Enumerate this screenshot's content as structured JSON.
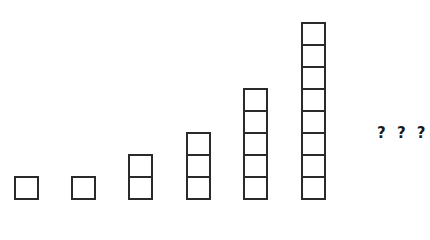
{
  "diagram": {
    "sequence": [
      1,
      1,
      2,
      3,
      5,
      8
    ],
    "columns": [
      {
        "index": 1,
        "squares": 1,
        "left": 14,
        "bottom": 200
      },
      {
        "index": 2,
        "squares": 1,
        "left": 71,
        "bottom": 200
      },
      {
        "index": 3,
        "squares": 2,
        "left": 128,
        "bottom": 200
      },
      {
        "index": 4,
        "squares": 3,
        "left": 186,
        "bottom": 200
      },
      {
        "index": 5,
        "squares": 5,
        "left": 243,
        "bottom": 200
      },
      {
        "index": 6,
        "squares": 8,
        "left": 301,
        "bottom": 200
      }
    ],
    "next_label": "? ? ?",
    "stroke_color": "#2a2a2a",
    "background_color": "#ffffff"
  }
}
